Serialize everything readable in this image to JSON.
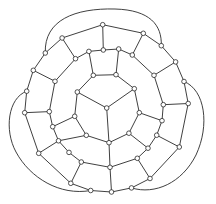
{
  "diagram": {
    "type": "planar-graph",
    "width": 216,
    "height": 204,
    "colors": {
      "edge": "#2a2a2a",
      "node_fill": "#ffffff",
      "node_stroke": "#2a2a2a",
      "background": "#ffffff"
    },
    "node_radius": 2.3,
    "nodes": [
      {
        "id": "c",
        "x": 106.7,
        "y": 108.0
      },
      {
        "id": "a1",
        "x": 77.3,
        "y": 92.0
      },
      {
        "id": "a2",
        "x": 93.3,
        "y": 75.3
      },
      {
        "id": "a3",
        "x": 116.0,
        "y": 74.7
      },
      {
        "id": "a4",
        "x": 134.3,
        "y": 88.7
      },
      {
        "id": "a5",
        "x": 139.3,
        "y": 112.7
      },
      {
        "id": "a6",
        "x": 74.7,
        "y": 116.3
      },
      {
        "id": "a7",
        "x": 86.3,
        "y": 135.3
      },
      {
        "id": "a8",
        "x": 109.0,
        "y": 142.7
      },
      {
        "id": "a9",
        "x": 128.9,
        "y": 133.2
      },
      {
        "id": "b1",
        "x": 88.9,
        "y": 51.4
      },
      {
        "id": "b2",
        "x": 103.3,
        "y": 50.0
      },
      {
        "id": "b3",
        "x": 118.7,
        "y": 49.0
      },
      {
        "id": "b4",
        "x": 132.3,
        "y": 55.0
      },
      {
        "id": "b5",
        "x": 154.0,
        "y": 75.3
      },
      {
        "id": "b6",
        "x": 163.3,
        "y": 104.7
      },
      {
        "id": "b7",
        "x": 162.0,
        "y": 120.7
      },
      {
        "id": "b8",
        "x": 156.7,
        "y": 135.2
      },
      {
        "id": "b9",
        "x": 148.0,
        "y": 148.2
      },
      {
        "id": "b10",
        "x": 137.3,
        "y": 158.3
      },
      {
        "id": "b11",
        "x": 110.0,
        "y": 167.3
      },
      {
        "id": "b12",
        "x": 81.3,
        "y": 162.0
      },
      {
        "id": "b13",
        "x": 69.0,
        "y": 152.4
      },
      {
        "id": "b14",
        "x": 58.5,
        "y": 140.8
      },
      {
        "id": "b15",
        "x": 52.7,
        "y": 126.7
      },
      {
        "id": "b16",
        "x": 49.3,
        "y": 111.6
      },
      {
        "id": "b17",
        "x": 55.0,
        "y": 81.3
      },
      {
        "id": "b18",
        "x": 75.5,
        "y": 58.7
      },
      {
        "id": "o1",
        "x": 62.1,
        "y": 38.0
      },
      {
        "id": "o2",
        "x": 102.7,
        "y": 24.7
      },
      {
        "id": "o3",
        "x": 143.3,
        "y": 33.3
      },
      {
        "id": "o4",
        "x": 161.3,
        "y": 45.7
      },
      {
        "id": "o5",
        "x": 175.6,
        "y": 61.9
      },
      {
        "id": "o6",
        "x": 184.0,
        "y": 81.5
      },
      {
        "id": "o7",
        "x": 188.2,
        "y": 103.5
      },
      {
        "id": "o8",
        "x": 179.3,
        "y": 147.0
      },
      {
        "id": "o9",
        "x": 150.0,
        "y": 178.5
      },
      {
        "id": "o10",
        "x": 131.5,
        "y": 187.9
      },
      {
        "id": "o11",
        "x": 111.5,
        "y": 192.0
      },
      {
        "id": "o12",
        "x": 90.7,
        "y": 190.5
      },
      {
        "id": "o13",
        "x": 70.8,
        "y": 183.3
      },
      {
        "id": "o14",
        "x": 38.7,
        "y": 153.3
      },
      {
        "id": "o15",
        "x": 24.7,
        "y": 112.7
      },
      {
        "id": "o16",
        "x": 26.7,
        "y": 91.2
      },
      {
        "id": "o17",
        "x": 33.3,
        "y": 70.3
      },
      {
        "id": "o18",
        "x": 45.3,
        "y": 53.0
      }
    ],
    "edges": [
      [
        "c",
        "a1"
      ],
      [
        "c",
        "a4"
      ],
      [
        "c",
        "a8"
      ],
      [
        "a1",
        "a2"
      ],
      [
        "a2",
        "a3"
      ],
      [
        "a3",
        "a4"
      ],
      [
        "a4",
        "a5"
      ],
      [
        "a1",
        "a6"
      ],
      [
        "a6",
        "a7"
      ],
      [
        "a7",
        "a8"
      ],
      [
        "a8",
        "a9"
      ],
      [
        "a9",
        "a5"
      ],
      [
        "a2",
        "b1"
      ],
      [
        "a3",
        "b3"
      ],
      [
        "a5",
        "b7"
      ],
      [
        "a9",
        "b9"
      ],
      [
        "a8",
        "b11"
      ],
      [
        "a7",
        "b14"
      ],
      [
        "a6",
        "b15"
      ],
      [
        "b1",
        "b2"
      ],
      [
        "b2",
        "b3"
      ],
      [
        "b3",
        "b4"
      ],
      [
        "b4",
        "b5"
      ],
      [
        "b5",
        "b6"
      ],
      [
        "b6",
        "b7"
      ],
      [
        "b7",
        "b8"
      ],
      [
        "b8",
        "b9"
      ],
      [
        "b9",
        "b10"
      ],
      [
        "b10",
        "b11"
      ],
      [
        "b11",
        "b12"
      ],
      [
        "b12",
        "b13"
      ],
      [
        "b13",
        "b14"
      ],
      [
        "b14",
        "b15"
      ],
      [
        "b15",
        "b16"
      ],
      [
        "b16",
        "b17"
      ],
      [
        "b17",
        "b18"
      ],
      [
        "b18",
        "b1"
      ],
      [
        "b2",
        "o2"
      ],
      [
        "b4",
        "o3"
      ],
      [
        "b5",
        "o5"
      ],
      [
        "b6",
        "o7"
      ],
      [
        "b8",
        "o8"
      ],
      [
        "b10",
        "o9"
      ],
      [
        "b11",
        "o11"
      ],
      [
        "b12",
        "o13"
      ],
      [
        "b14",
        "o14"
      ],
      [
        "b16",
        "o15"
      ],
      [
        "b17",
        "o17"
      ],
      [
        "b18",
        "o1"
      ],
      [
        "o1",
        "o2"
      ],
      [
        "o2",
        "o3"
      ],
      [
        "o3",
        "o4"
      ],
      [
        "o4",
        "o5"
      ],
      [
        "o5",
        "o6"
      ],
      [
        "o6",
        "o7"
      ],
      [
        "o7",
        "o8"
      ],
      [
        "o8",
        "o9"
      ],
      [
        "o9",
        "o10"
      ],
      [
        "o10",
        "o11"
      ],
      [
        "o11",
        "o12"
      ],
      [
        "o12",
        "o13"
      ],
      [
        "o13",
        "o14"
      ],
      [
        "o14",
        "o15"
      ],
      [
        "o15",
        "o16"
      ],
      [
        "o16",
        "o17"
      ],
      [
        "o17",
        "o18"
      ],
      [
        "o18",
        "o1"
      ]
    ],
    "curves": [
      {
        "id": "top-arc",
        "from": "o18",
        "to": "o4",
        "d": "M45.3,53.0 C44,20 75,8 115,9 C150,10 162,25 161.3,45.7"
      },
      {
        "id": "right-arc",
        "from": "o6",
        "to": "o10",
        "d": "M184.0,81.5 C205,90 210,125 196,155 C182,183 155,195 131.5,187.9"
      },
      {
        "id": "left-arc",
        "from": "o16",
        "to": "o12",
        "d": "M26.7,91.2 C8,98 4,130 16,152 C30,178 60,196 90.7,190.5"
      }
    ]
  }
}
